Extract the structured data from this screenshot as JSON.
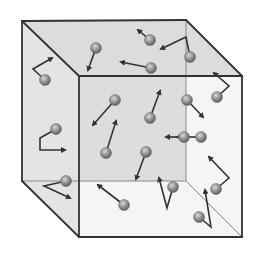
{
  "diagram": {
    "colors": {
      "background": "#ffffff",
      "edge": "#333333",
      "hidden_edge": "#8a8a8a",
      "face_top": "#dcdcdc",
      "face_left": "#e4e4e4",
      "face_front": "#ececec",
      "face_back": "#c9c9c9",
      "molecule": "#8c8c8c",
      "molecule_highlight": "#d8d8d8",
      "arrow": "#333333"
    },
    "cube": {
      "back_top_left": [
        22,
        21
      ],
      "back_top_right": [
        186,
        20
      ],
      "back_bottom_left": [
        22,
        181
      ],
      "back_bottom_right": [
        186,
        181
      ],
      "front_top_left": [
        79,
        76
      ],
      "front_top_right": [
        242,
        76
      ],
      "front_bottom_right": [
        242,
        237
      ],
      "front_bottom_left": [
        79,
        237
      ]
    },
    "molecules": [
      {
        "x": 45,
        "y": 80,
        "path": [
          [
            45,
            80
          ],
          [
            33,
            69
          ],
          [
            52,
            58
          ]
        ]
      },
      {
        "x": 96,
        "y": 48,
        "path": [
          [
            96,
            48
          ],
          [
            88,
            70
          ]
        ]
      },
      {
        "x": 150,
        "y": 40,
        "path": [
          [
            150,
            40
          ],
          [
            138,
            30
          ]
        ]
      },
      {
        "x": 151,
        "y": 68,
        "path": [
          [
            151,
            68
          ],
          [
            121,
            62
          ]
        ]
      },
      {
        "x": 190,
        "y": 57,
        "path": [
          [
            190,
            57
          ],
          [
            186,
            37
          ],
          [
            161,
            49
          ]
        ]
      },
      {
        "x": 217,
        "y": 97,
        "path": [
          [
            217,
            97
          ],
          [
            229,
            86
          ],
          [
            214,
            73
          ]
        ]
      },
      {
        "x": 115,
        "y": 100,
        "path": [
          [
            115,
            100
          ],
          [
            93,
            125
          ]
        ]
      },
      {
        "x": 150,
        "y": 118,
        "path": [
          [
            150,
            118
          ],
          [
            160,
            91
          ]
        ]
      },
      {
        "x": 187,
        "y": 100,
        "path": [
          [
            187,
            100
          ],
          [
            203,
            117
          ]
        ]
      },
      {
        "x": 56,
        "y": 129,
        "path": [
          [
            56,
            129
          ],
          [
            40,
            138
          ],
          [
            40,
            150
          ],
          [
            65,
            150
          ]
        ]
      },
      {
        "x": 106,
        "y": 153,
        "path": [
          [
            106,
            153
          ],
          [
            116,
            121
          ]
        ]
      },
      {
        "x": 201,
        "y": 137,
        "path": [
          [
            201,
            137
          ],
          [
            177,
            137
          ]
        ]
      },
      {
        "x": 146,
        "y": 152,
        "path": [
          [
            146,
            152
          ],
          [
            136,
            179
          ]
        ]
      },
      {
        "x": 184,
        "y": 137,
        "path": [
          [
            184,
            137
          ],
          [
            166,
            137
          ]
        ]
      },
      {
        "x": 216,
        "y": 189,
        "path": [
          [
            216,
            189
          ],
          [
            229,
            178
          ],
          [
            209,
            157
          ]
        ]
      },
      {
        "x": 66,
        "y": 181,
        "path": [
          [
            66,
            181
          ],
          [
            44,
            186
          ],
          [
            70,
            198
          ]
        ]
      },
      {
        "x": 124,
        "y": 205,
        "path": [
          [
            124,
            205
          ],
          [
            98,
            185
          ]
        ]
      },
      {
        "x": 173,
        "y": 187,
        "path": [
          [
            173,
            187
          ],
          [
            167,
            208
          ],
          [
            159,
            178
          ]
        ]
      },
      {
        "x": 199,
        "y": 217,
        "path": [
          [
            199,
            217
          ],
          [
            211,
            227
          ],
          [
            205,
            190
          ]
        ]
      }
    ]
  }
}
